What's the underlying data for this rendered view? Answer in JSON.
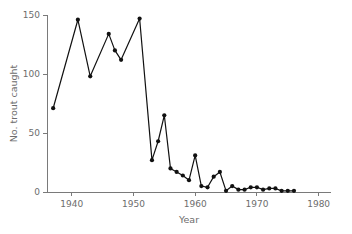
{
  "chart_data": {
    "type": "line",
    "title": "",
    "subtitle": "",
    "xlabel": "Year",
    "ylabel": "No. trout caught",
    "xlim": [
      1936,
      1982
    ],
    "ylim": [
      0,
      150
    ],
    "xticks": [
      1940,
      1950,
      1960,
      1970,
      1980
    ],
    "xtick_labels": [
      "1940",
      "1950",
      "1960",
      "1970",
      "1980"
    ],
    "yticks": [
      0,
      50,
      100,
      150
    ],
    "ytick_labels": [
      "0",
      "50",
      "100",
      "150"
    ],
    "grid": false,
    "legend": null,
    "marker": "filled-circle",
    "line_color": "#111111",
    "axis_color": "#7a7a7a",
    "text_color": "#6d6d6d",
    "background": "#ffffff",
    "x": [
      1937,
      1941,
      1943,
      1946,
      1947,
      1948,
      1951,
      1953,
      1954,
      1955,
      1956,
      1957,
      1958,
      1959,
      1960,
      1961,
      1962,
      1963,
      1964,
      1965,
      1966,
      1967,
      1968,
      1969,
      1970,
      1971,
      1972,
      1973,
      1974,
      1975,
      1976
    ],
    "values": [
      71,
      146,
      98,
      134,
      120,
      112,
      147,
      27,
      43,
      65,
      20,
      17,
      14,
      10,
      31,
      5,
      4,
      13,
      17,
      1,
      5,
      2,
      2,
      4,
      4,
      2,
      3,
      3,
      1,
      1,
      1
    ],
    "series": [
      {
        "name": "No. trout caught",
        "x": [
          1937,
          1941,
          1943,
          1946,
          1947,
          1948,
          1951,
          1953,
          1954,
          1955,
          1956,
          1957,
          1958,
          1959,
          1960,
          1961,
          1962,
          1963,
          1964,
          1965,
          1966,
          1967,
          1968,
          1969,
          1970,
          1971,
          1972,
          1973,
          1974,
          1975,
          1976
        ],
        "values": [
          71,
          146,
          98,
          134,
          120,
          112,
          147,
          27,
          43,
          65,
          20,
          17,
          14,
          10,
          31,
          5,
          4,
          13,
          17,
          1,
          5,
          2,
          2,
          4,
          4,
          2,
          3,
          3,
          1,
          1,
          1
        ]
      }
    ],
    "annotations": []
  }
}
